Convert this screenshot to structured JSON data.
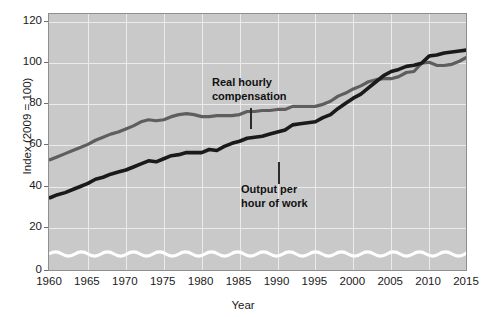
{
  "chart_data": {
    "type": "line",
    "title": "",
    "xlabel": "Year",
    "ylabel": "Index (2009 = 100)",
    "xlim": [
      1960,
      2015
    ],
    "ylim": [
      0,
      120
    ],
    "ytick_values": [
      0,
      20,
      40,
      60,
      80,
      100,
      120
    ],
    "ytick_labels": [
      "0",
      "20",
      "40",
      "60",
      "80",
      "100",
      "120"
    ],
    "xtick_values": [
      1960,
      1965,
      1970,
      1975,
      1980,
      1985,
      1990,
      1995,
      2000,
      2005,
      2010,
      2015
    ],
    "xtick_labels": [
      "1960",
      "1965",
      "1970",
      "1975",
      "1980",
      "1985",
      "1990",
      "1995",
      "2000",
      "2005",
      "2010",
      "2015"
    ],
    "grid": true,
    "legend_position": "inline-annotations",
    "axis_break": true,
    "axis_break_note": "wavy break in y-axis between 0 and about 10",
    "plot_background": "#c9c9c9",
    "gridline_color": "#eceaea",
    "x": [
      1960,
      1961,
      1962,
      1963,
      1964,
      1965,
      1966,
      1967,
      1968,
      1969,
      1970,
      1971,
      1972,
      1973,
      1974,
      1975,
      1976,
      1977,
      1978,
      1979,
      1980,
      1981,
      1982,
      1983,
      1984,
      1985,
      1986,
      1987,
      1988,
      1989,
      1990,
      1991,
      1992,
      1993,
      1994,
      1995,
      1996,
      1997,
      1998,
      1999,
      2000,
      2001,
      2002,
      2003,
      2004,
      2005,
      2006,
      2007,
      2008,
      2009,
      2010,
      2011,
      2012,
      2013,
      2014,
      2015
    ],
    "series": [
      {
        "name": "Real hourly compensation",
        "color": "#5e5e5e",
        "annotation": "Real hourly\ncompensation",
        "values": [
          53,
          54.5,
          56,
          57.5,
          59,
          60.5,
          62.5,
          64,
          65.5,
          66.5,
          68,
          69.5,
          71.5,
          72.5,
          72,
          72.5,
          74,
          75,
          75.5,
          75,
          74,
          74,
          74.5,
          74.5,
          74.5,
          75,
          76.5,
          76.5,
          77,
          77,
          77.5,
          77.5,
          79,
          79,
          79,
          79,
          80,
          81.5,
          84,
          85.5,
          87.5,
          89,
          91,
          92,
          92.5,
          92.5,
          93.5,
          95.5,
          96,
          100,
          100.5,
          99,
          99,
          99.5,
          101,
          103
        ]
      },
      {
        "name": "Output per hour of work",
        "color": "#1a1a1a",
        "annotation": "Output per\nhour of work",
        "values": [
          34.5,
          36,
          37,
          38.5,
          40,
          41.5,
          43.5,
          44.5,
          46,
          47,
          48,
          49.5,
          51,
          52.5,
          52,
          53.5,
          55,
          55.5,
          56.5,
          56.5,
          56.5,
          58,
          57.5,
          59.5,
          61,
          62,
          63.5,
          64,
          64.5,
          65.5,
          66.5,
          67.5,
          70,
          70.5,
          71,
          71.5,
          73.5,
          75,
          78,
          80.5,
          83,
          85,
          88,
          91,
          94,
          96,
          97,
          98.5,
          99,
          100,
          103.5,
          104,
          105,
          105.5,
          106,
          106.5
        ]
      }
    ]
  },
  "annotations": {
    "real_hourly": "Real hourly\ncompensation",
    "output_per_hour": "Output per\nhour of work"
  },
  "axes": {
    "y_title": "Index (2009 = 100)",
    "x_title": "Year"
  }
}
